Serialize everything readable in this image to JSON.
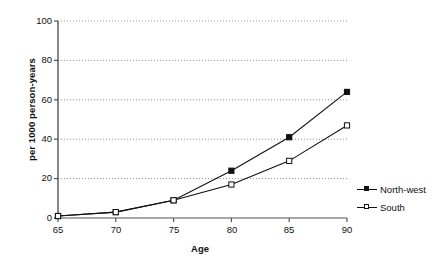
{
  "chart_data": {
    "type": "line",
    "title": "",
    "xlabel": "Age",
    "ylabel": "per 1000 person-years",
    "x": [
      65,
      70,
      75,
      80,
      85,
      90
    ],
    "xticklabels": [
      "65",
      "70",
      "75",
      "80",
      "85",
      "90"
    ],
    "yticklabels": [
      "0",
      "20",
      "40",
      "60",
      "80",
      "100"
    ],
    "xlim": [
      65,
      90
    ],
    "ylim": [
      0,
      100
    ],
    "grid": "horizontal-dotted",
    "legend_position": "right",
    "series": [
      {
        "name": "North-west",
        "marker": "filled-square",
        "color": "#111111",
        "values": [
          1,
          3,
          9,
          24,
          41,
          64
        ]
      },
      {
        "name": "South",
        "marker": "open-square",
        "color": "#111111",
        "values": [
          1,
          3,
          9,
          17,
          29,
          47
        ]
      }
    ]
  },
  "axes": {
    "y_title": "per 1000 person-years",
    "x_title": "Age",
    "y_ticks": [
      "100",
      "80",
      "60",
      "40",
      "20",
      "0"
    ],
    "x_ticks": [
      "65",
      "70",
      "75",
      "80",
      "85",
      "90"
    ]
  },
  "legend": {
    "items": [
      {
        "label": "North-west",
        "marker": "filled-square"
      },
      {
        "label": "South",
        "marker": "open-square"
      }
    ]
  }
}
